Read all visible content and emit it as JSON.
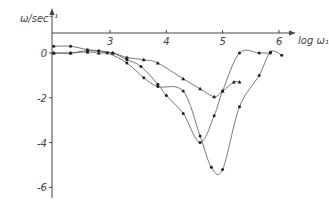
{
  "chart_data": {
    "type": "line",
    "title": "",
    "xlabel": "log ω₁",
    "ylabel": "ω/sec⁻¹",
    "xlim": [
      2.0,
      6.3
    ],
    "ylim": [
      -6.3,
      0.9
    ],
    "x_ticks": [
      "3",
      "4",
      "5",
      "6"
    ],
    "x_tick_values": [
      3,
      4,
      5,
      6
    ],
    "y_ticks": [
      "0",
      "-2",
      "-4",
      "-6"
    ],
    "y_tick_values": [
      0,
      -2,
      -4,
      -6
    ],
    "grid": false,
    "series": [
      {
        "name": "triangles",
        "marker": "triangle",
        "x": [
          2.0,
          2.3,
          2.6,
          2.8,
          3.05,
          3.3,
          3.6,
          3.85,
          4.3,
          4.6,
          4.85,
          5.0,
          5.2,
          5.3
        ],
        "y": [
          0,
          0,
          0.05,
          0,
          0,
          -0.2,
          -0.3,
          -0.45,
          -1.15,
          -1.6,
          -1.95,
          -1.7,
          -1.3,
          -1.3
        ]
      },
      {
        "name": "circles-middle",
        "marker": "circle",
        "x": [
          2.0,
          2.3,
          2.6,
          2.8,
          3.05,
          3.3,
          3.55,
          3.85,
          4.0,
          4.3,
          4.6,
          4.85,
          5.0,
          5.3,
          5.65,
          5.85
        ],
        "y": [
          0.3,
          0.3,
          0.15,
          0.1,
          0,
          -0.3,
          -0.6,
          -1.4,
          -1.9,
          -2.7,
          -4.0,
          -2.8,
          -1.7,
          0,
          0,
          0
        ]
      },
      {
        "name": "circles-deep",
        "marker": "circle",
        "x": [
          2.0,
          2.3,
          2.6,
          2.95,
          3.3,
          3.6,
          3.85,
          4.3,
          4.6,
          4.8,
          5.0,
          5.3,
          5.65,
          5.85,
          6.05
        ],
        "y": [
          0,
          0,
          0.1,
          0,
          -0.45,
          -1.1,
          -1.5,
          -1.7,
          -3.7,
          -5.1,
          -5.2,
          -2.4,
          -1.0,
          0.05,
          -0.1
        ]
      }
    ]
  }
}
